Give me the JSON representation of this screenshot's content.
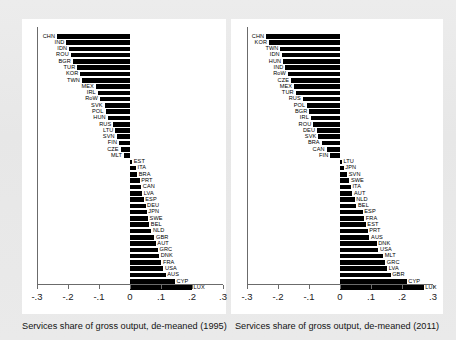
{
  "figure": {
    "panels": [
      {
        "id": "panel-1995",
        "xlabel": "Services share of gross output, de-meaned (1995)",
        "xticklabels": [
          "-.3",
          "-.2",
          "-.1",
          "0",
          ".1",
          ".2",
          ".3"
        ]
      },
      {
        "id": "panel-2011",
        "xlabel": "Services share of gross output, de-meaned (2011)",
        "xticklabels": [
          "-.3",
          "-.2",
          "-.1",
          "0",
          ".1",
          ".2",
          ".3"
        ]
      }
    ]
  },
  "chart_data": [
    {
      "type": "bar",
      "orientation": "horizontal",
      "title": "",
      "xlabel": "Services share of gross output, de-meaned (1995)",
      "ylabel": "",
      "xlim": [
        -0.3,
        0.3
      ],
      "xticks": [
        -0.3,
        -0.2,
        -0.1,
        0,
        0.1,
        0.2,
        0.3
      ],
      "xticklabels": [
        "-.3",
        "-.2",
        "-.1",
        "0",
        ".1",
        ".2",
        ".3"
      ],
      "grid": false,
      "legend": "none",
      "bar_color": "#000000",
      "categories": [
        "CHN",
        "IND",
        "IDN",
        "ROU",
        "BGR",
        "TUR",
        "KOR",
        "TWN",
        "MEX",
        "IRL",
        "RoW",
        "SVK",
        "POL",
        "HUN",
        "RUS",
        "LTU",
        "SVN",
        "FIN",
        "CZE",
        "MLT",
        "EST",
        "ITA",
        "BRA",
        "PRT",
        "CAN",
        "LVA",
        "ESP",
        "DEU",
        "JPN",
        "SWE",
        "BEL",
        "NLD",
        "GBR",
        "AUT",
        "GRC",
        "DNK",
        "FRA",
        "USA",
        "AUS",
        "CYP",
        "LUX"
      ],
      "values": [
        -0.235,
        -0.205,
        -0.196,
        -0.191,
        -0.184,
        -0.17,
        -0.16,
        -0.155,
        -0.11,
        -0.104,
        -0.097,
        -0.082,
        -0.079,
        -0.072,
        -0.054,
        -0.047,
        -0.043,
        -0.035,
        -0.03,
        -0.019,
        0.007,
        0.019,
        0.023,
        0.031,
        0.036,
        0.039,
        0.044,
        0.05,
        0.054,
        0.058,
        0.062,
        0.069,
        0.079,
        0.083,
        0.09,
        0.094,
        0.101,
        0.108,
        0.115,
        0.145,
        0.2
      ]
    },
    {
      "type": "bar",
      "orientation": "horizontal",
      "title": "",
      "xlabel": "Services share of gross output, de-meaned (2011)",
      "ylabel": "",
      "xlim": [
        -0.3,
        0.3
      ],
      "xticks": [
        -0.3,
        -0.2,
        -0.1,
        0,
        0.1,
        0.2,
        0.3
      ],
      "xticklabels": [
        "-.3",
        "-.2",
        "-.1",
        "0",
        ".1",
        ".2",
        ".3"
      ],
      "grid": false,
      "legend": "none",
      "bar_color": "#000000",
      "categories": [
        "CHN",
        "KOR",
        "TWN",
        "IDN",
        "HUN",
        "IND",
        "RoW",
        "CZE",
        "MEX",
        "TUR",
        "RUS",
        "POL",
        "BGR",
        "IRL",
        "ROU",
        "DEU",
        "SVK",
        "BRA",
        "CAN",
        "FIN",
        "LTU",
        "JPN",
        "SVN",
        "SWE",
        "ITA",
        "AUT",
        "NLD",
        "BEL",
        "ESP",
        "FRA",
        "EST",
        "PRT",
        "AUS",
        "DNK",
        "USA",
        "MLT",
        "GRC",
        "LVA",
        "GBR",
        "CYP",
        "LUX"
      ],
      "values": [
        -0.238,
        -0.229,
        -0.192,
        -0.188,
        -0.183,
        -0.176,
        -0.168,
        -0.158,
        -0.148,
        -0.143,
        -0.12,
        -0.106,
        -0.099,
        -0.094,
        -0.086,
        -0.074,
        -0.07,
        -0.059,
        -0.043,
        -0.031,
        0.006,
        0.012,
        0.023,
        0.03,
        0.035,
        0.04,
        0.047,
        0.053,
        0.073,
        0.078,
        0.083,
        0.089,
        0.095,
        0.118,
        0.124,
        0.139,
        0.146,
        0.152,
        0.163,
        0.215,
        0.27
      ]
    }
  ]
}
